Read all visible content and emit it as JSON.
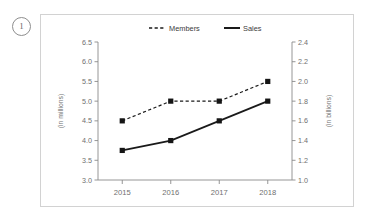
{
  "item_number": "1",
  "chart_data": {
    "type": "line",
    "title": "",
    "xlabel": "",
    "categories": [
      "2015",
      "2016",
      "2017",
      "2018"
    ],
    "grid": false,
    "legend_position": "top",
    "left_axis": {
      "title": "(in millions)",
      "min": 3.0,
      "max": 6.5,
      "step": 0.5,
      "ticks": [
        "3.0",
        "3.5",
        "4.0",
        "4.5",
        "5.0",
        "5.5",
        "6.0",
        "6.5"
      ],
      "tick_values": [
        3.0,
        3.5,
        4.0,
        4.5,
        5.0,
        5.5,
        6.0,
        6.5
      ]
    },
    "right_axis": {
      "title": "(in billions)",
      "min": 1.0,
      "max": 2.4,
      "step": 0.2,
      "ticks": [
        "1.0",
        "1.2",
        "1.4",
        "1.6",
        "1.8",
        "2.0",
        "2.2",
        "2.4"
      ],
      "tick_values": [
        1.0,
        1.2,
        1.4,
        1.6,
        1.8,
        2.0,
        2.2,
        2.4
      ]
    },
    "series": [
      {
        "name": "Members",
        "axis": "left",
        "style": "dashed",
        "marker": "square",
        "color": "#1a1a1a",
        "values": [
          4.5,
          5.0,
          5.0,
          5.5
        ]
      },
      {
        "name": "Sales",
        "axis": "right",
        "style": "solid",
        "marker": "square",
        "color": "#1a1a1a",
        "values": [
          1.3,
          1.4,
          1.6,
          1.8
        ]
      }
    ]
  }
}
